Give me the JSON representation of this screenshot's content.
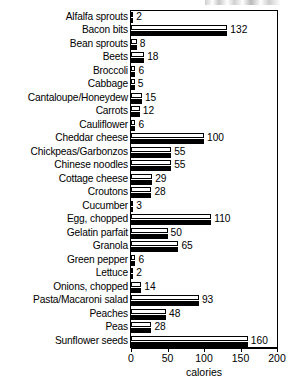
{
  "chart_data": {
    "type": "bar",
    "orientation": "horizontal",
    "title": "",
    "xlabel": "calories",
    "ylabel": "",
    "xlim": [
      0,
      200
    ],
    "xticks": [
      0,
      50,
      100,
      150,
      200
    ],
    "xtick_labels": [
      "0",
      "50",
      "100",
      "150",
      "200"
    ],
    "grid": false,
    "legend": false,
    "bar_style": "paired white-outline over solid-black",
    "categories": [
      "Alfalfa sprouts",
      "Bacon bits",
      "Bean sprouts",
      "Beets",
      "Broccoli",
      "Cabbage",
      "Cantaloupe/Honeydew",
      "Carrots",
      "Cauliflower",
      "Cheddar cheese",
      "Chickpeas/Garbonzos",
      "Chinese noodles",
      "Cottage cheese",
      "Croutons",
      "Cucumber",
      "Egg, chopped",
      "Gelatin parfait",
      "Granola",
      "Green pepper",
      "Lettuce",
      "Onions, chopped",
      "Pasta/Macaroni salad",
      "Peaches",
      "Peas",
      "Sunflower seeds"
    ],
    "values": [
      2,
      132,
      8,
      18,
      6,
      5,
      15,
      12,
      6,
      100,
      55,
      55,
      29,
      28,
      3,
      110,
      50,
      65,
      6,
      2,
      14,
      93,
      48,
      28,
      160
    ],
    "value_labels": [
      "2",
      "132",
      "8",
      "18",
      "6",
      "5",
      "15",
      "12",
      "6",
      "100",
      "55",
      "55",
      "29",
      "28",
      "3",
      "110",
      "50",
      "65",
      "6",
      "2",
      "14",
      "93",
      "48",
      "28",
      "160"
    ],
    "colors": {
      "bar_top_fill": "#ffffff",
      "bar_bottom_fill": "#000000",
      "bar_outline": "#000000",
      "axis": "#000000",
      "text": "#000000",
      "background": "#ffffff"
    }
  }
}
